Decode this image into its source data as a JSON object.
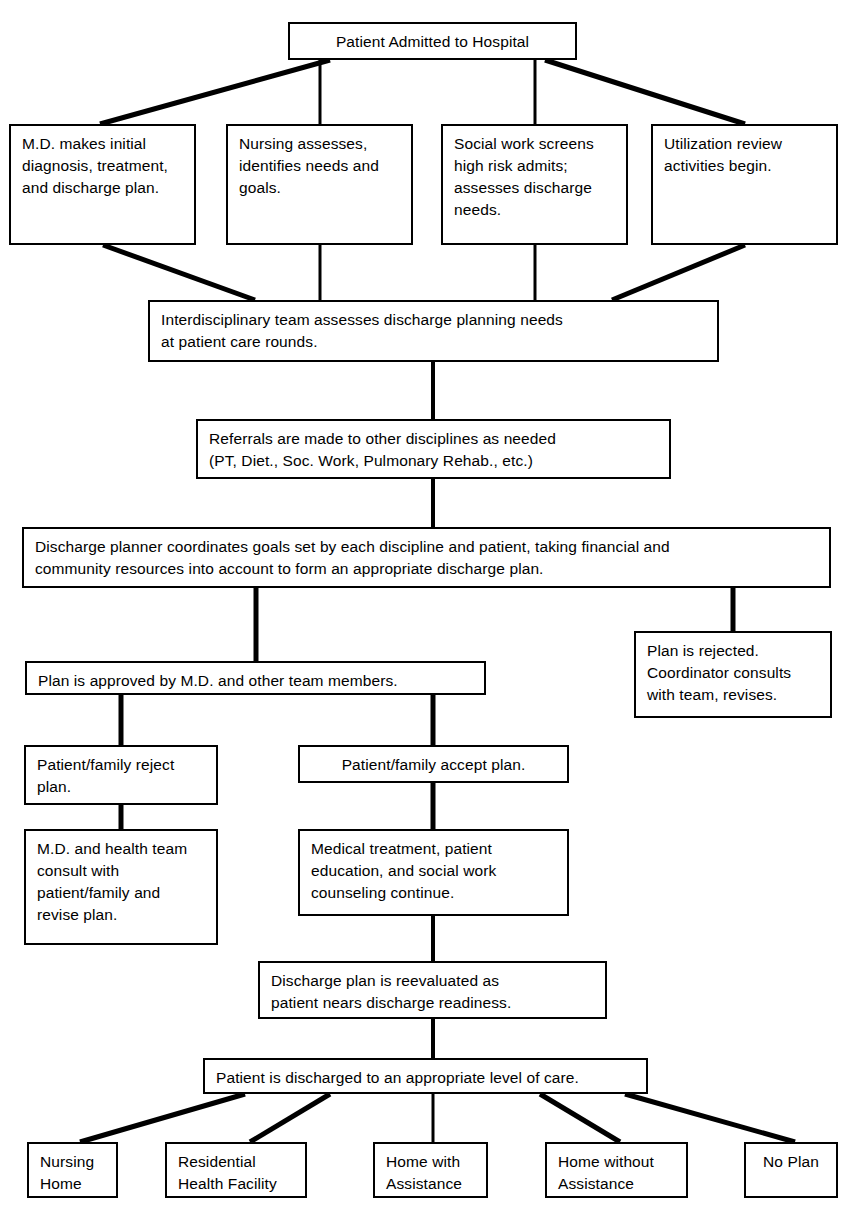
{
  "diagram": {
    "type": "flowchart",
    "line_color": "#000000",
    "box_fill": "#ffffff",
    "nodes": [
      {
        "id": "admitted",
        "label": "Patient Admitted to Hospital",
        "x": 288,
        "y": 22,
        "w": 289,
        "h": 38,
        "align": "center"
      },
      {
        "id": "md_initial",
        "label": "M.D. makes initial\ndiagnosis, treatment,\nand discharge plan.",
        "x": 9,
        "y": 124,
        "w": 187,
        "h": 121,
        "align": "left"
      },
      {
        "id": "nursing",
        "label": "Nursing assesses,\nidentifies needs and\ngoals.",
        "x": 226,
        "y": 124,
        "w": 187,
        "h": 121,
        "align": "left"
      },
      {
        "id": "social_work",
        "label": "Social work screens\nhigh risk admits;\nassesses discharge\nneeds.",
        "x": 441,
        "y": 124,
        "w": 187,
        "h": 121,
        "align": "left"
      },
      {
        "id": "utilization",
        "label": "Utilization review\nactivities begin.",
        "x": 651,
        "y": 124,
        "w": 187,
        "h": 121,
        "align": "left"
      },
      {
        "id": "team_assess",
        "label": "Interdisciplinary team assesses discharge planning needs\nat patient care rounds.",
        "x": 148,
        "y": 300,
        "w": 571,
        "h": 62,
        "align": "left"
      },
      {
        "id": "referrals",
        "label": "Referrals are made to other disciplines as needed\n(PT, Diet., Soc. Work, Pulmonary Rehab., etc.)",
        "x": 196,
        "y": 419,
        "w": 475,
        "h": 60,
        "align": "left"
      },
      {
        "id": "planner",
        "label": "Discharge planner coordinates goals set by each discipline and patient, taking financial and\ncommunity resources into account to form an appropriate discharge plan.",
        "x": 22,
        "y": 527,
        "w": 809,
        "h": 61,
        "align": "left"
      },
      {
        "id": "rejected",
        "label": "Plan is rejected.\nCoordinator consults\nwith team, revises.",
        "x": 634,
        "y": 631,
        "w": 198,
        "h": 87,
        "align": "left"
      },
      {
        "id": "approved",
        "label": "Plan is approved by M.D. and other team members.",
        "x": 25,
        "y": 661,
        "w": 461,
        "h": 34,
        "align": "left"
      },
      {
        "id": "family_reject",
        "label": "Patient/family reject\nplan.",
        "x": 24,
        "y": 745,
        "w": 194,
        "h": 60,
        "align": "left"
      },
      {
        "id": "family_accept",
        "label": "Patient/family accept plan.",
        "x": 298,
        "y": 745,
        "w": 271,
        "h": 38,
        "align": "center"
      },
      {
        "id": "md_consult",
        "label": "M.D. and health team\nconsult with\npatient/family and\nrevise plan.",
        "x": 24,
        "y": 829,
        "w": 194,
        "h": 116,
        "align": "left"
      },
      {
        "id": "medical_tx",
        "label": "Medical treatment, patient\neducation, and social work\ncounseling continue.",
        "x": 298,
        "y": 829,
        "w": 271,
        "h": 87,
        "align": "left"
      },
      {
        "id": "reevaluated",
        "label": "Discharge plan is reevaluated as\npatient nears discharge readiness.",
        "x": 258,
        "y": 961,
        "w": 349,
        "h": 58,
        "align": "left"
      },
      {
        "id": "discharged",
        "label": "Patient is discharged to an appropriate level of care.",
        "x": 203,
        "y": 1058,
        "w": 445,
        "h": 36,
        "align": "left"
      },
      {
        "id": "nursing_home",
        "label": "Nursing\nHome",
        "x": 27,
        "y": 1142,
        "w": 91,
        "h": 56,
        "align": "left"
      },
      {
        "id": "res_health",
        "label": "Residential\nHealth Facility",
        "x": 165,
        "y": 1142,
        "w": 142,
        "h": 56,
        "align": "left"
      },
      {
        "id": "home_with",
        "label": "Home with\nAssistance",
        "x": 373,
        "y": 1142,
        "w": 115,
        "h": 56,
        "align": "left"
      },
      {
        "id": "home_without",
        "label": "Home without\nAssistance",
        "x": 545,
        "y": 1142,
        "w": 143,
        "h": 56,
        "align": "left"
      },
      {
        "id": "no_plan",
        "label": "No Plan",
        "x": 744,
        "y": 1142,
        "w": 94,
        "h": 56,
        "align": "center"
      }
    ],
    "edges": [
      {
        "from": "admitted",
        "to": "md_initial",
        "style": "diagonal"
      },
      {
        "from": "admitted",
        "to": "nursing",
        "style": "vertical"
      },
      {
        "from": "admitted",
        "to": "social_work",
        "style": "vertical"
      },
      {
        "from": "admitted",
        "to": "utilization",
        "style": "diagonal"
      },
      {
        "from": "md_initial",
        "to": "team_assess",
        "style": "diagonal"
      },
      {
        "from": "nursing",
        "to": "team_assess",
        "style": "vertical"
      },
      {
        "from": "social_work",
        "to": "team_assess",
        "style": "vertical"
      },
      {
        "from": "utilization",
        "to": "team_assess",
        "style": "diagonal"
      },
      {
        "from": "team_assess",
        "to": "referrals",
        "style": "vertical"
      },
      {
        "from": "referrals",
        "to": "planner",
        "style": "vertical"
      },
      {
        "from": "planner",
        "to": "approved",
        "style": "vertical"
      },
      {
        "from": "planner",
        "to": "rejected",
        "style": "vertical"
      },
      {
        "from": "approved",
        "to": "family_reject",
        "style": "vertical"
      },
      {
        "from": "approved",
        "to": "family_accept",
        "style": "vertical"
      },
      {
        "from": "family_reject",
        "to": "md_consult",
        "style": "vertical"
      },
      {
        "from": "family_accept",
        "to": "medical_tx",
        "style": "vertical"
      },
      {
        "from": "medical_tx",
        "to": "reevaluated",
        "style": "vertical"
      },
      {
        "from": "reevaluated",
        "to": "discharged",
        "style": "vertical"
      },
      {
        "from": "discharged",
        "to": "nursing_home",
        "style": "diagonal"
      },
      {
        "from": "discharged",
        "to": "res_health",
        "style": "diagonal"
      },
      {
        "from": "discharged",
        "to": "home_with",
        "style": "vertical"
      },
      {
        "from": "discharged",
        "to": "home_without",
        "style": "diagonal"
      },
      {
        "from": "discharged",
        "to": "no_plan",
        "style": "diagonal"
      }
    ],
    "connector_paths": [
      {
        "name": "admitted-to-md-initial",
        "d": "M 330 60 L 100 124",
        "w": 5
      },
      {
        "name": "admitted-to-nursing",
        "d": "M 320 60 L 320 124",
        "w": 3
      },
      {
        "name": "admitted-to-social-work",
        "d": "M 535 60 L 535 124",
        "w": 3
      },
      {
        "name": "admitted-to-utilization",
        "d": "M 545 60 L 745 124",
        "w": 5
      },
      {
        "name": "md-initial-to-team",
        "d": "M 103 245 L 255 300",
        "w": 5
      },
      {
        "name": "nursing-to-team",
        "d": "M 320 245 L 320 300",
        "w": 3
      },
      {
        "name": "social-work-to-team",
        "d": "M 535 245 L 535 300",
        "w": 3
      },
      {
        "name": "utilization-to-team",
        "d": "M 745 245 L 612 300",
        "w": 5
      },
      {
        "name": "team-to-referrals",
        "d": "M 433 362 L 433 419",
        "w": 4
      },
      {
        "name": "referrals-to-planner",
        "d": "M 433 479 L 433 527",
        "w": 4
      },
      {
        "name": "planner-to-approved",
        "d": "M 256 588 L 256 661",
        "w": 5
      },
      {
        "name": "planner-to-rejected",
        "d": "M 733 588 L 733 631",
        "w": 5
      },
      {
        "name": "approved-to-family-reject",
        "d": "M 121 695 L 121 745",
        "w": 5
      },
      {
        "name": "approved-to-family-accept",
        "d": "M 433 695 L 433 745",
        "w": 5
      },
      {
        "name": "family-reject-to-md-consult",
        "d": "M 121 805 L 121 829",
        "w": 5
      },
      {
        "name": "family-accept-to-medical",
        "d": "M 433 783 L 433 829",
        "w": 5
      },
      {
        "name": "medical-to-reevaluated",
        "d": "M 433 916 L 433 961",
        "w": 4
      },
      {
        "name": "reevaluated-to-discharged",
        "d": "M 433 1019 L 433 1058",
        "w": 4
      },
      {
        "name": "discharged-to-nursing-home",
        "d": "M 245 1094 L 80 1142",
        "w": 5
      },
      {
        "name": "discharged-to-res-health",
        "d": "M 330 1094 L 250 1142",
        "w": 5
      },
      {
        "name": "discharged-to-home-with",
        "d": "M 433 1094 L 433 1142",
        "w": 3
      },
      {
        "name": "discharged-to-home-without",
        "d": "M 540 1094 L 620 1142",
        "w": 5
      },
      {
        "name": "discharged-to-no-plan",
        "d": "M 625 1094 L 795 1142",
        "w": 5
      }
    ]
  }
}
